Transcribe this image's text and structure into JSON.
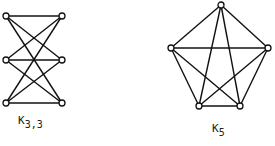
{
  "graphs": [
    {
      "id": "k33",
      "label_main": "K",
      "label_sub": "3,3",
      "nodes": [
        {
          "x": 6,
          "y": 16
        },
        {
          "x": 6,
          "y": 60
        },
        {
          "x": 6,
          "y": 103
        },
        {
          "x": 62,
          "y": 16
        },
        {
          "x": 62,
          "y": 60
        },
        {
          "x": 62,
          "y": 103
        }
      ],
      "edges": [
        [
          0,
          3
        ],
        [
          0,
          4
        ],
        [
          0,
          5
        ],
        [
          1,
          3
        ],
        [
          1,
          4
        ],
        [
          1,
          5
        ],
        [
          2,
          3
        ],
        [
          2,
          4
        ],
        [
          2,
          5
        ]
      ]
    },
    {
      "id": "k5",
      "label_main": "K",
      "label_sub": "5",
      "nodes": [
        {
          "x": 221,
          "y": 5
        },
        {
          "x": 171,
          "y": 48
        },
        {
          "x": 268,
          "y": 48
        },
        {
          "x": 199,
          "y": 106
        },
        {
          "x": 240,
          "y": 106
        }
      ],
      "edges": [
        [
          0,
          1
        ],
        [
          0,
          2
        ],
        [
          0,
          3
        ],
        [
          0,
          4
        ],
        [
          1,
          2
        ],
        [
          1,
          3
        ],
        [
          1,
          4
        ],
        [
          2,
          3
        ],
        [
          2,
          4
        ],
        [
          3,
          4
        ]
      ]
    }
  ],
  "colors": {
    "stroke": "#111111",
    "background": "#ffffff"
  }
}
